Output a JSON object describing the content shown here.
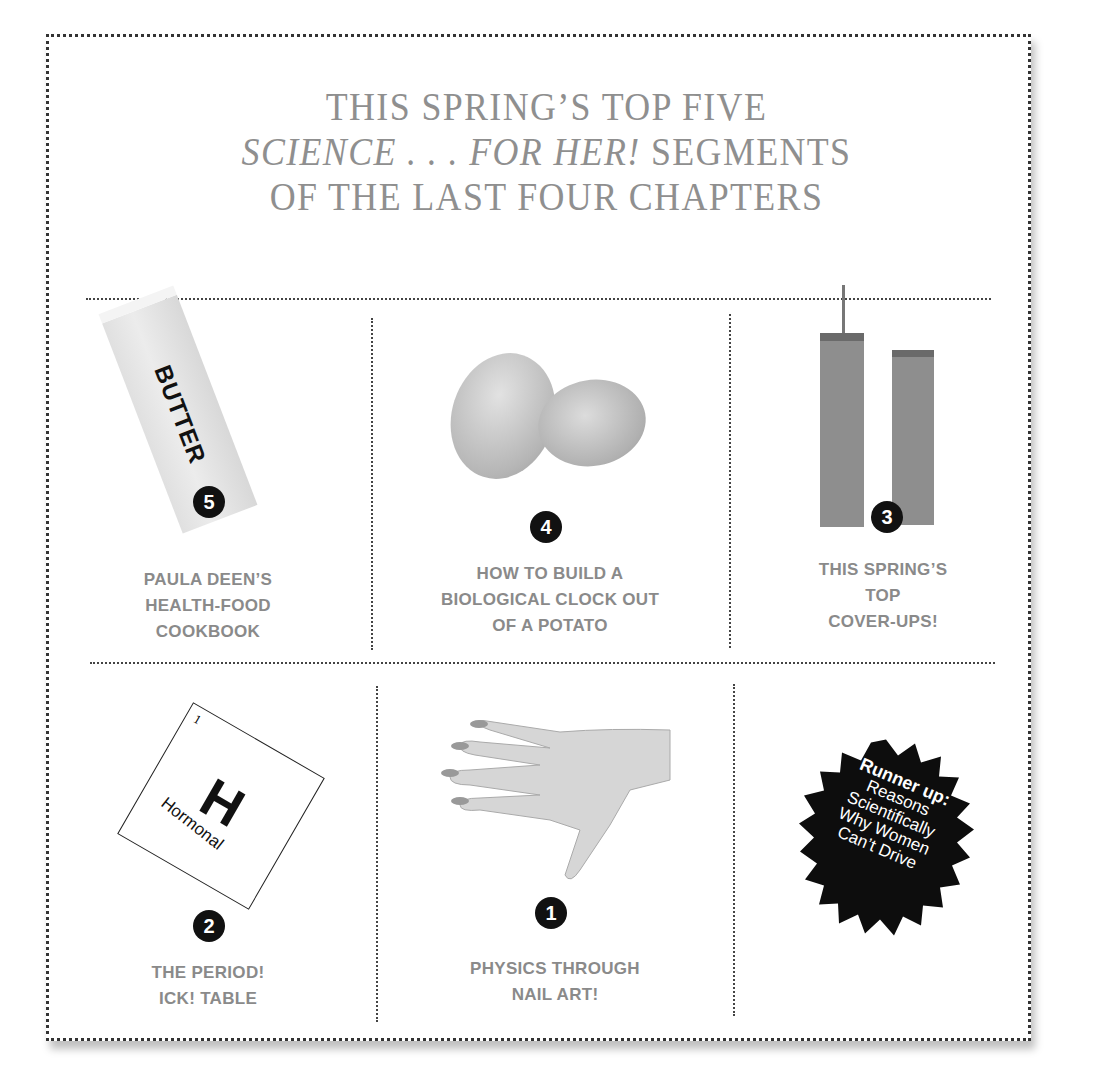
{
  "title": {
    "line1": "THIS SPRING’S TOP FIVE",
    "line2_italic": "SCIENCE . . . FOR HER!",
    "line2_rest": " SEGMENTS",
    "line3": "OF THE LAST FOUR CHAPTERS"
  },
  "items": [
    {
      "rank": "5",
      "image": "butter-stick",
      "image_text": "BUTTER",
      "label_lines": [
        "PAULA DEEN’S",
        "HEALTH-FOOD",
        "COOKBOOK"
      ]
    },
    {
      "rank": "4",
      "image": "potatoes",
      "label_lines": [
        "HOW TO BUILD A",
        "BIOLOGICAL CLOCK OUT",
        "OF A POTATO"
      ]
    },
    {
      "rank": "3",
      "image": "twin-towers",
      "label_lines": [
        "THIS SPRING’S",
        "TOP",
        "COVER-UPS!"
      ]
    },
    {
      "rank": "2",
      "image": "periodic-element",
      "element_number": "1",
      "element_symbol": "H",
      "element_name": "Hormonal",
      "label_lines": [
        "THE PERIOD!",
        "ICK! TABLE"
      ]
    },
    {
      "rank": "1",
      "image": "hand-nails",
      "label_lines": [
        "PHYSICS THROUGH",
        "NAIL ART!"
      ]
    }
  ],
  "runner_up": {
    "heading": "Runner up:",
    "lines": [
      "Reasons",
      "Scientifically",
      "Why Women",
      "Can’t Drive"
    ]
  },
  "colors": {
    "title": "#8f8f8f",
    "label": "#8a8a8a",
    "badge": "#111111",
    "border": "#333333"
  }
}
